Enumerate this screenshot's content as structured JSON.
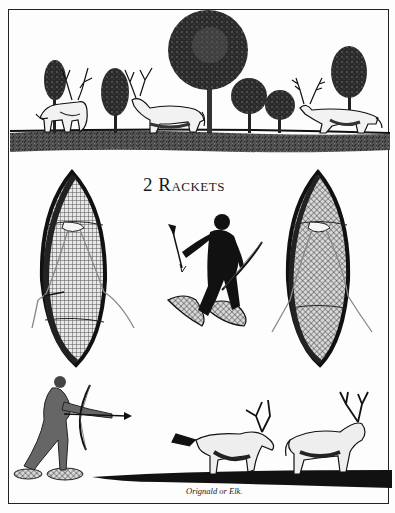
{
  "plate": {
    "title": "2 Rackets",
    "caption": "Orignald or Elk.",
    "colors": {
      "ink": "#111111",
      "paper": "#fdfdfd",
      "mesh": "#555555"
    }
  },
  "scenes": {
    "top": {
      "description": "Landscape with trees and three deer on a grassy ground strip",
      "elements": [
        "tree",
        "deer",
        "tree",
        "deer",
        "large-tree",
        "tree",
        "tree",
        "deer",
        "tree"
      ]
    },
    "middle": {
      "description": "Two snowshoe rackets flanking a hunter on snowshoes holding an arrow and a bow",
      "elements": [
        "left-snowshoe",
        "hunter-on-snowshoes",
        "right-snowshoe"
      ]
    },
    "bottom": {
      "description": "Archer on snowshoes shooting at two elk on dark ground",
      "elements": [
        "archer",
        "elk",
        "elk"
      ]
    }
  }
}
